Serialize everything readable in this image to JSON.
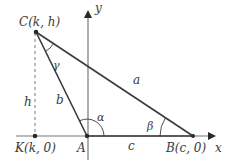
{
  "diagram": {
    "type": "triangle-on-coordinate-plane",
    "colors": {
      "lines": "#3a3a3a",
      "axes": "#777777",
      "text": "#3a3a3a",
      "background": "#ffffff"
    },
    "axes": {
      "x_label": "x",
      "y_label": "y"
    },
    "points": {
      "C": {
        "label": "C(k, h)",
        "x": 36,
        "y": 32
      },
      "A": {
        "label": "A",
        "x": 87,
        "y": 136
      },
      "B": {
        "label": "B(c, 0)",
        "x": 193,
        "y": 136
      },
      "K": {
        "label": "K(k, 0)",
        "x": 35,
        "y": 136
      }
    },
    "sides": {
      "a": "a",
      "b": "b",
      "c": "c",
      "h": "h"
    },
    "angles": {
      "alpha": "α",
      "beta": "β",
      "gamma": "γ"
    }
  }
}
